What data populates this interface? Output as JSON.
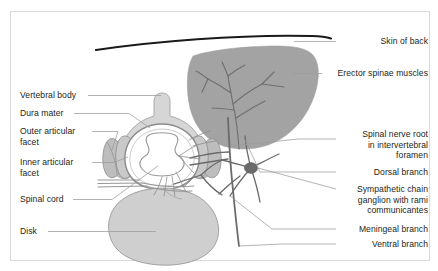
{
  "figure": {
    "background_color": "#ffffff",
    "frame_color": "#d9d9d9",
    "text_color": "#231f20",
    "leader_line_color": "#9b9b9b",
    "colors": {
      "skin_line": "#1a1a1a",
      "muscle_fill": "#a3a3a3",
      "muscle_nerve": "#6f6f6f",
      "bone_fill": "#d6d6d6",
      "bone_stroke": "#9a9a9a",
      "disk_fill": "#cfcfcf",
      "disk_stroke": "#9a9a9a",
      "dura_fill": "#ffffff",
      "dura_stroke": "#8c8c8c",
      "cord_fill": "#ffffff",
      "cord_stroke": "#9a9a9a",
      "facet_fill": "#bdbdbd",
      "nerve_stroke": "#6b6b6b",
      "ganglion_fill": "#6b6b6b"
    }
  },
  "labels_left": [
    {
      "id": "vertebral-body",
      "text": "Vertebral body",
      "x": 20,
      "y": 92
    },
    {
      "id": "dura-mater",
      "text": "Dura mater",
      "x": 20,
      "y": 110
    },
    {
      "id": "outer-articular-facet",
      "text": "Outer articular\nfacet",
      "x": 20,
      "y": 128
    },
    {
      "id": "inner-articular-facet",
      "text": "Inner articular\nfacet",
      "x": 20,
      "y": 159
    },
    {
      "id": "spinal-cord",
      "text": "Spinal cord",
      "x": 20,
      "y": 196
    },
    {
      "id": "disk",
      "text": "Disk",
      "x": 20,
      "y": 228
    }
  ],
  "labels_right": [
    {
      "id": "skin-of-back",
      "text": "Skin of back",
      "right": 10,
      "y": 38
    },
    {
      "id": "erector-spinae-muscles",
      "text": "Erector spinae muscles",
      "right": 10,
      "y": 70
    },
    {
      "id": "spinal-nerve-root",
      "text": "Spinal nerve root\nin intervertebral\nforamen",
      "right": 10,
      "y": 131
    },
    {
      "id": "dorsal-branch",
      "text": "Dorsal branch",
      "right": 10,
      "y": 169
    },
    {
      "id": "sympathetic-chain-ganglion",
      "text": "Sympathetic chain\nganglion with rami\ncommunicantes",
      "right": 10,
      "y": 186
    },
    {
      "id": "meningeal-branch",
      "text": "Meningeal branch",
      "right": 10,
      "y": 226
    },
    {
      "id": "ventral-branch",
      "text": "Ventral branch",
      "right": 10,
      "y": 241
    }
  ],
  "anatomy_parts": [
    {
      "id": "skin-of-back",
      "kind": "line"
    },
    {
      "id": "erector-spinae-muscles",
      "kind": "filled-shape"
    },
    {
      "id": "vertebral-body",
      "kind": "filled-shape"
    },
    {
      "id": "spinous-process",
      "kind": "filled-shape"
    },
    {
      "id": "outer-articular-facet",
      "kind": "filled-shape"
    },
    {
      "id": "inner-articular-facet",
      "kind": "filled-shape"
    },
    {
      "id": "dura-mater",
      "kind": "ring"
    },
    {
      "id": "spinal-cord",
      "kind": "filled-shape"
    },
    {
      "id": "disk",
      "kind": "filled-shape"
    },
    {
      "id": "spinal-nerve-root",
      "kind": "line"
    },
    {
      "id": "dorsal-branch",
      "kind": "line"
    },
    {
      "id": "ventral-branch",
      "kind": "line"
    },
    {
      "id": "meningeal-branch",
      "kind": "line"
    },
    {
      "id": "sympathetic-chain-ganglion",
      "kind": "node"
    }
  ]
}
